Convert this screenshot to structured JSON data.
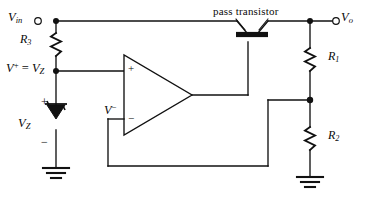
{
  "diagram": {
    "line_color": "#111111",
    "background": "#ffffff"
  },
  "terminals": {
    "input": {
      "label_v": "V",
      "label_sub": "in",
      "name": "V_in"
    },
    "output": {
      "label_v": "V",
      "label_sub": "o",
      "name": "V_o"
    }
  },
  "labels": {
    "r3": {
      "symbol": "R",
      "sub": "3"
    },
    "r1": {
      "symbol": "R",
      "sub": "1"
    },
    "r2": {
      "symbol": "R",
      "sub": "2"
    },
    "vz": {
      "symbol": "V",
      "sub": "Z"
    },
    "v_plus_node": {
      "text_v": "V",
      "sup": "+",
      "eq": " = ",
      "text_v2": "V",
      "sub2": "Z"
    },
    "v_minus": {
      "symbol": "V",
      "sup": "−"
    },
    "pass_transistor": "pass transistor"
  },
  "signs": {
    "zener_plus": "+",
    "zener_minus": "−",
    "opamp_noninverting": "+",
    "opamp_inverting": "−"
  },
  "components": [
    {
      "id": "r3",
      "type": "resistor",
      "orientation": "vertical",
      "label": "R3"
    },
    {
      "id": "dz",
      "type": "zener-diode",
      "orientation": "vertical",
      "label": "VZ"
    },
    {
      "id": "opamp",
      "type": "operational-amplifier",
      "inputs": [
        "+",
        "−"
      ]
    },
    {
      "id": "q1",
      "type": "bipolar-pass-transistor",
      "label": "pass transistor"
    },
    {
      "id": "r1",
      "type": "resistor",
      "orientation": "vertical",
      "label": "R1"
    },
    {
      "id": "r2",
      "type": "resistor",
      "orientation": "vertical",
      "label": "R2"
    },
    {
      "id": "gnd-left",
      "type": "ground"
    },
    {
      "id": "gnd-right",
      "type": "ground"
    }
  ]
}
